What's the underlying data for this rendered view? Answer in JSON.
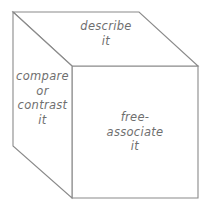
{
  "figure": {
    "type": "isometric-cube-diagram",
    "background_color": "#ffffff",
    "line_color": "#8a8a8a",
    "text_color": "#6f6f6f",
    "faces": {
      "top": {
        "name": "describe",
        "label": "describe\nit"
      },
      "left": {
        "name": "compare or contrast",
        "label": "compare\nor\ncontrast\nit"
      },
      "front": {
        "name": "free-associate",
        "label": "free-\nassociate\nit"
      }
    }
  }
}
